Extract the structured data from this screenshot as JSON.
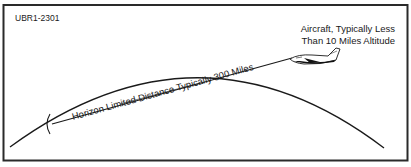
{
  "figure": {
    "id_label": "UBR1-2301",
    "aircraft_label": {
      "line1": "Aircraft, Typically Less",
      "line2": "Than 10 Miles Altitude"
    },
    "line_label": "Horizon Limited Distance Typically 300 Miles",
    "elements": {
      "earth_curve": "earth-horizon-arc",
      "sight_line": "line-of-sight",
      "aircraft_icon": "aircraft-icon",
      "endpoint_marker": "horizon-endpoint-bracket"
    },
    "colors": {
      "stroke": "#1a1a1a",
      "background": "#ffffff",
      "frame": "#2a2a2a"
    }
  }
}
